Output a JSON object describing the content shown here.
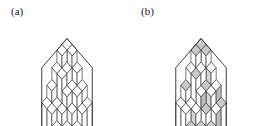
{
  "figure": {
    "kind": "lozenge-tiling-hexagon-pair",
    "background_color": "#ffffff",
    "width": 269,
    "height": 126
  },
  "panels": [
    {
      "id": "a",
      "label": "(a)",
      "shaded": false,
      "description": "Lozenge (rhombus) tiling of a regular hexagon of side 5, drawn with plain outlines, reading as a stack of unit cubes in a 5x5x5 box."
    },
    {
      "id": "b",
      "label": "(b)",
      "shaded": true,
      "description": "The same lozenge tiling of the regular hexagon of side 5, with a subset of the rhombi filled light gray."
    }
  ],
  "geometry": {
    "hexagon_side_cells": 5,
    "cell_width": 10.1,
    "cell_height": 5.85,
    "center_x": 67,
    "center_y": 65,
    "height_matrix_rows": 5,
    "height_matrix_cols": 5,
    "height_matrix": [
      [
        5,
        5,
        4,
        3,
        2
      ],
      [
        5,
        4,
        4,
        2,
        2
      ],
      [
        4,
        3,
        3,
        2,
        1
      ],
      [
        3,
        3,
        2,
        1,
        1
      ],
      [
        2,
        2,
        1,
        1,
        0
      ]
    ]
  },
  "style": {
    "line_color": "#3c3c3c",
    "line_width": 0.7,
    "outer_line_color": "#2b2b2b",
    "outer_line_width": 0.9,
    "face_white": "#ffffff",
    "face_light": "#fdfdfd",
    "shade_gray": "#c9c9c9",
    "shade_gray_dark": "#bdbdbd",
    "shade_gray_light": "#d6d6d6"
  },
  "shading_pattern": {
    "note": "In panel (b) the gray fill marks selected lozenges of all three orientations.",
    "top_faces_shaded": [
      [
        0,
        0
      ],
      [
        0,
        1
      ],
      [
        0,
        3
      ],
      [
        1,
        0
      ],
      [
        1,
        2
      ],
      [
        2,
        1
      ],
      [
        2,
        4
      ],
      [
        3,
        2
      ],
      [
        3,
        3
      ],
      [
        4,
        0
      ],
      [
        4,
        2
      ],
      [
        4,
        4
      ]
    ],
    "left_faces_shaded": [
      [
        0,
        0
      ],
      [
        1,
        1
      ],
      [
        2,
        0
      ],
      [
        2,
        3
      ],
      [
        3,
        1
      ],
      [
        4,
        2
      ],
      [
        4,
        4
      ]
    ],
    "right_faces_shaded": [
      [
        0,
        2
      ],
      [
        1,
        3
      ],
      [
        2,
        2
      ],
      [
        3,
        0
      ],
      [
        3,
        4
      ],
      [
        4,
        1
      ],
      [
        4,
        3
      ]
    ]
  }
}
